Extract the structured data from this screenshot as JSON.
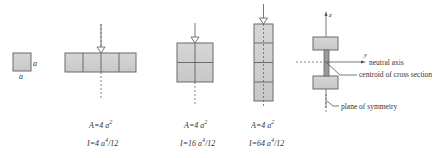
{
  "figure": {
    "unit_square": {
      "side_label_right": "a",
      "side_label_bottom": "a"
    },
    "sections": [
      {
        "id": "flat",
        "layout": "4x1 horizontal",
        "area_label": "A=4 a",
        "area_exp": "2",
        "inertia_label": "I=4 a",
        "inertia_exp": "4",
        "inertia_suffix": "/12"
      },
      {
        "id": "square",
        "layout": "2x2",
        "area_label": "A=4 a",
        "area_exp": "2",
        "inertia_label": "I=16 a",
        "inertia_exp": "4",
        "inertia_suffix": "/12"
      },
      {
        "id": "tall",
        "layout": "1x4 vertical",
        "area_label": "A=4 a",
        "area_exp": "2",
        "inertia_label": "I=64 a",
        "inertia_exp": "4",
        "inertia_suffix": "/12"
      }
    ],
    "ibeam": {
      "z_axis_label": "z",
      "y_axis_label": "y",
      "neutral_axis_label": "neutral axis",
      "centroid_label": "centroid of cross section",
      "symmetry_label": "plane of symmetry"
    },
    "colors": {
      "fill": "#cfcfcf",
      "stroke": "#6a6a6a",
      "line": "#555555"
    }
  }
}
